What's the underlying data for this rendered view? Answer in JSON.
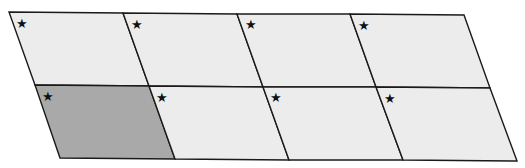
{
  "diagram": {
    "rows": 2,
    "columns": 4,
    "colors": {
      "cell_fill": "#ececec",
      "shaded_fill": "#a9a9a9",
      "stroke": "#1a1a1a",
      "star": "#111111"
    },
    "marker_glyph": "★",
    "cells": [
      {
        "row": 0,
        "col": 0,
        "shaded": false,
        "marker": "★"
      },
      {
        "row": 0,
        "col": 1,
        "shaded": false,
        "marker": "★"
      },
      {
        "row": 0,
        "col": 2,
        "shaded": false,
        "marker": "★"
      },
      {
        "row": 0,
        "col": 3,
        "shaded": false,
        "marker": "★"
      },
      {
        "row": 1,
        "col": 0,
        "shaded": true,
        "marker": "★"
      },
      {
        "row": 1,
        "col": 1,
        "shaded": false,
        "marker": "★"
      },
      {
        "row": 1,
        "col": 2,
        "shaded": false,
        "marker": "★"
      },
      {
        "row": 1,
        "col": 3,
        "shaded": false,
        "marker": "★"
      }
    ]
  }
}
